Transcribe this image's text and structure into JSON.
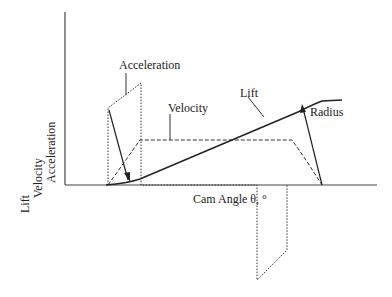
{
  "diagram": {
    "y_axis_labels": [
      "Lift",
      "Velocity",
      "Acceleration"
    ],
    "x_axis_label": "Cam Angle θ, °",
    "callouts": {
      "acceleration": "Acceleration",
      "velocity": "Velocity",
      "lift": "Lift",
      "radius": "Radius"
    },
    "colors": {
      "line": "#222222",
      "background": "#ffffff"
    }
  }
}
